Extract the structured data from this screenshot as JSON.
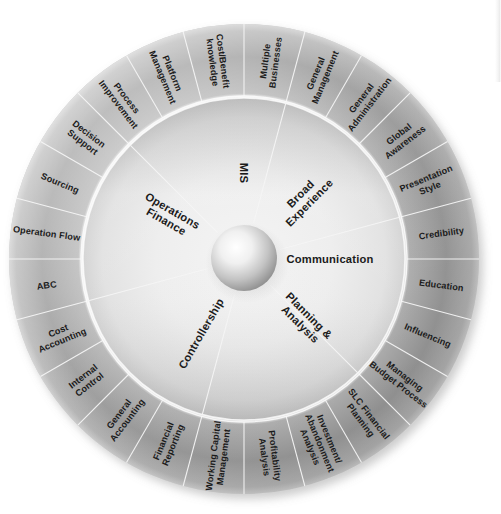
{
  "diagram": {
    "type": "radial-wheel",
    "background_color": "#ffffff",
    "text_color": "#1b1b1b",
    "divider_color": "#f4f4f4",
    "geometry": {
      "center_x": 244,
      "center_y": 259,
      "outer_radius": 235,
      "outer_ring_inner_radius": 163,
      "inner_ring_outer_radius": 160,
      "hub_radius": 33
    }
  },
  "center_hub": {
    "name": "center-sphere",
    "label": "",
    "highlight_color": "#ffffff",
    "shade_color": "#8e8e8e"
  },
  "inner_ring": {
    "count": 6,
    "sectors": [
      {
        "label": "Operations\nFinance",
        "line1": "Operations",
        "line2": "Finance",
        "angle": 300
      },
      {
        "label": "MIS",
        "line1": "MIS",
        "line2": "",
        "angle": 0
      },
      {
        "label": "Broad\nExperience",
        "line1": "Broad",
        "line2": "Experience",
        "angle": 45
      },
      {
        "label": "Communication",
        "line1": "Communication",
        "line2": "",
        "angle": 90
      },
      {
        "label": "Planning &\nAnalysis",
        "line1": "Planning &",
        "line2": "Analysis",
        "angle": 135
      },
      {
        "label": "Controllership",
        "line1": "Controllership",
        "line2": "",
        "angle": 210
      }
    ]
  },
  "outer_ring": {
    "count": 24,
    "start_angle_deg": -105,
    "segments": [
      {
        "index": 0,
        "label": "ABC",
        "lines": [
          "ABC"
        ]
      },
      {
        "index": 1,
        "label": "Operation Flow",
        "lines": [
          "Operation Flow"
        ]
      },
      {
        "index": 2,
        "label": "Sourcing",
        "lines": [
          "Sourcing"
        ]
      },
      {
        "index": 3,
        "label": "Decision Support",
        "lines": [
          "Decision",
          "Support"
        ]
      },
      {
        "index": 4,
        "label": "Process Improvement",
        "lines": [
          "Process",
          "Improvement"
        ]
      },
      {
        "index": 5,
        "label": "Platform Management",
        "lines": [
          "Platform",
          "Management"
        ]
      },
      {
        "index": 6,
        "label": "Cost/Benefit knowledge",
        "lines": [
          "Cost/Benefit",
          "knowledge"
        ]
      },
      {
        "index": 7,
        "label": "Multiple Businesses",
        "lines": [
          "Multiple",
          "Businesses"
        ]
      },
      {
        "index": 8,
        "label": "General Management",
        "lines": [
          "General",
          "Management"
        ]
      },
      {
        "index": 9,
        "label": "General Administration",
        "lines": [
          "General",
          "Administration"
        ]
      },
      {
        "index": 10,
        "label": "Global Awareness",
        "lines": [
          "Global",
          "Awareness"
        ]
      },
      {
        "index": 11,
        "label": "Presentation Style",
        "lines": [
          "Presentation",
          "Style"
        ]
      },
      {
        "index": 12,
        "label": "Credibility",
        "lines": [
          "Credibility"
        ]
      },
      {
        "index": 13,
        "label": "Education",
        "lines": [
          "Education"
        ]
      },
      {
        "index": 14,
        "label": "Influencing",
        "lines": [
          "Influencing"
        ]
      },
      {
        "index": 15,
        "label": "Managing Budget Process",
        "lines": [
          "Managing",
          "Budget Process"
        ]
      },
      {
        "index": 16,
        "label": "SLC Financial Planning",
        "lines": [
          "SLC Financial",
          "Planning"
        ]
      },
      {
        "index": 17,
        "label": "Investment/ Abandonment Analysis",
        "lines": [
          "Investment/",
          "Abandonment",
          "Analysis"
        ]
      },
      {
        "index": 18,
        "label": "Profitability Analysis",
        "lines": [
          "Profitability",
          "Analysis"
        ]
      },
      {
        "index": 19,
        "label": "Working Capital Management",
        "lines": [
          "Working Capital",
          "Management"
        ]
      },
      {
        "index": 20,
        "label": "Financial Reporting",
        "lines": [
          "Financial",
          "Reporting"
        ]
      },
      {
        "index": 21,
        "label": "General Accounting",
        "lines": [
          "General",
          "Accounting"
        ]
      },
      {
        "index": 22,
        "label": "Internal Control",
        "lines": [
          "Internal",
          "Control"
        ]
      },
      {
        "index": 23,
        "label": "Cost Accounting",
        "lines": [
          "Cost",
          "Accounting"
        ]
      }
    ]
  }
}
